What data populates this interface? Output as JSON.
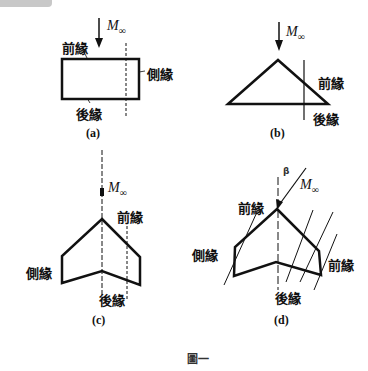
{
  "figure_caption": "圖一",
  "mach_symbol": "M",
  "mach_subscript": "∞",
  "beta_label": "β",
  "panels": {
    "a": {
      "caption": "(a)",
      "leading_edge": "前緣",
      "side_edge": "側緣",
      "trailing_edge": "後緣"
    },
    "b": {
      "caption": "(b)",
      "leading_edge": "前緣",
      "trailing_edge": "後緣"
    },
    "c": {
      "caption": "(c)",
      "leading_edge": "前緣",
      "side_edge": "側緣",
      "trailing_edge": "後緣"
    },
    "d": {
      "caption": "(d)",
      "leading_edge": "前緣",
      "leading_edge_2": "前緣",
      "side_edge": "側緣",
      "trailing_edge": "後緣"
    }
  }
}
